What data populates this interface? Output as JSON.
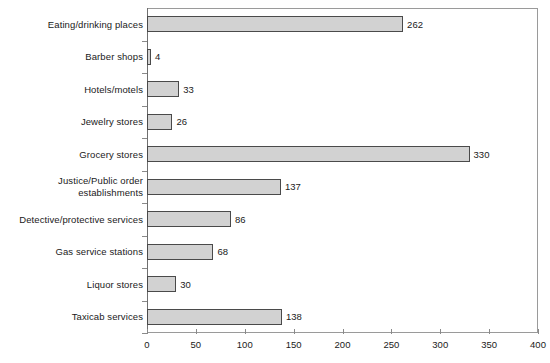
{
  "chart_data": {
    "type": "bar",
    "orientation": "horizontal",
    "title": "",
    "subtitle": "",
    "xlabel": "",
    "ylabel": "",
    "xlim": [
      0,
      400
    ],
    "xticks": [
      0,
      50,
      100,
      150,
      200,
      250,
      300,
      350,
      400
    ],
    "grid": false,
    "legend": null,
    "bar_fill_color": "#d2d2d2",
    "bar_border_color": "#4a4a4a",
    "axis_color": "#8a8a8a",
    "categories": [
      "Eating/drinking places",
      "Barber shops",
      "Hotels/motels",
      "Jewelry stores",
      "Grocery stores",
      "Justice/Public order\nestablishments",
      "Detective/protective services",
      "Gas service stations",
      "Liquor stores",
      "Taxicab services"
    ],
    "values": [
      262,
      4,
      33,
      26,
      330,
      137,
      86,
      68,
      30,
      138
    ],
    "value_labels": [
      "262",
      "4",
      "33",
      "26",
      "330",
      "137",
      "86",
      "68",
      "30",
      "138"
    ],
    "tick_labels": [
      "0",
      "50",
      "100",
      "150",
      "200",
      "250",
      "300",
      "350",
      "400"
    ]
  }
}
